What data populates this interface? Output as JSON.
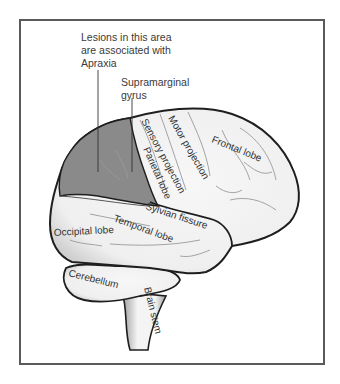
{
  "figure": {
    "colors": {
      "background": "#ffffff",
      "frame": "#5a5a5a",
      "brain_fill": "#f3f3f3",
      "brain_outline": "#1e1e1e",
      "lesion_fill": "#8a8a8a",
      "sulci": "#9a9a9a",
      "text": "#333333"
    },
    "callouts": {
      "apraxia": {
        "lines": [
          "Lesions in this area",
          "are associated with",
          "Apraxia"
        ]
      },
      "supramarginal": {
        "lines": [
          "Supramarginal",
          "gyrus"
        ]
      }
    },
    "labels": {
      "motor_projection": "Motor projection",
      "sensory_projection": "Sensory projection",
      "parietal_lobe": "Parietal lobe",
      "frontal_lobe": "Frontal lobe",
      "sylvian_fissure": "Sylvian fissure",
      "temporal_lobe": "Temporal lobe",
      "occipital_lobe": "Occipital lobe",
      "cerebellum": "Cerebellum",
      "brain_stem": "Brain stem"
    }
  }
}
